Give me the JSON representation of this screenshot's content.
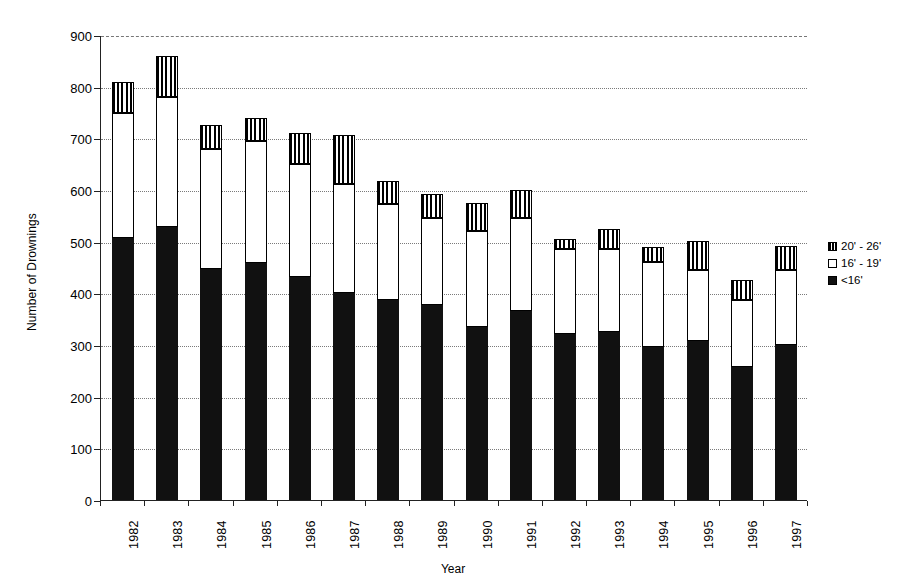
{
  "chart_data": {
    "type": "bar",
    "subtype": "stacked-bar",
    "title": "",
    "xlabel": "Year",
    "ylabel": "Number of Drownings",
    "ylim": [
      0,
      900
    ],
    "ytick_step": 100,
    "yticks": [
      0,
      100,
      200,
      300,
      400,
      500,
      600,
      700,
      800,
      900
    ],
    "ytick_labels": [
      "0",
      "100",
      "200",
      "300",
      "400",
      "500",
      "600",
      "700",
      "800",
      "900"
    ],
    "grid": true,
    "grid_axis": "y",
    "legend_position": "right",
    "categories": [
      "1982",
      "1983",
      "1984",
      "1985",
      "1986",
      "1987",
      "1988",
      "1989",
      "1990",
      "1991",
      "1992",
      "1993",
      "1994",
      "1995",
      "1996",
      "1997"
    ],
    "series": [
      {
        "name": "<16'",
        "pattern": "solid-black",
        "color": "#111111",
        "values": [
          508,
          528,
          448,
          458,
          432,
          400,
          387,
          378,
          335,
          365,
          322,
          325,
          297,
          308,
          258,
          300
        ]
      },
      {
        "name": "16' - 19'",
        "pattern": "white-empty",
        "color": "#ffffff",
        "values": [
          242,
          252,
          232,
          237,
          218,
          212,
          185,
          167,
          185,
          180,
          163,
          160,
          163,
          137,
          130,
          145
        ]
      },
      {
        "name": "20' - 26'",
        "pattern": "vertical-stripes",
        "color": "#000000",
        "values": [
          60,
          80,
          45,
          45,
          60,
          95,
          45,
          48,
          55,
          55,
          20,
          40,
          30,
          57,
          37,
          47
        ]
      }
    ],
    "totals": [
      810,
      860,
      725,
      740,
      710,
      707,
      617,
      593,
      575,
      600,
      505,
      525,
      490,
      502,
      425,
      492
    ]
  },
  "legend": {
    "items": [
      {
        "label": "20' - 26'",
        "swatch": "sw-large"
      },
      {
        "label": "16' - 19'",
        "swatch": "sw-mid"
      },
      {
        "label": "<16'",
        "swatch": "sw-small"
      }
    ]
  }
}
